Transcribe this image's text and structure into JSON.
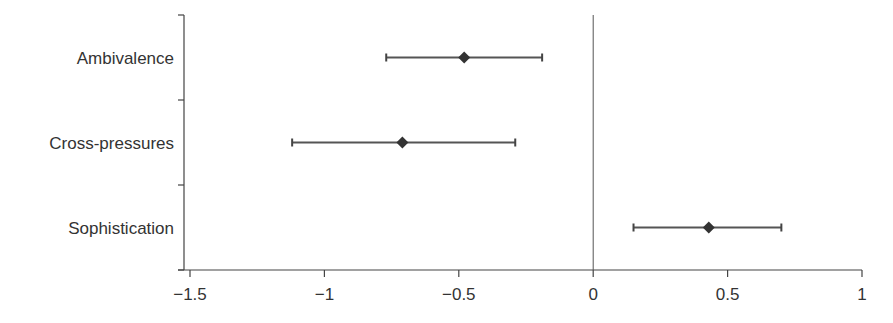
{
  "chart_data": {
    "type": "scatter",
    "subtype": "coefficient-plot-with-confidence-intervals",
    "title": "",
    "xlabel": "",
    "ylabel": "",
    "xlim": [
      -1.5,
      1
    ],
    "xticks": [
      -1.5,
      -1,
      -0.5,
      0,
      0.5,
      1
    ],
    "xtick_labels": [
      "−1.5",
      "−1",
      "−0.5",
      "0",
      "0.5",
      "1"
    ],
    "reference_line_x": 0,
    "grid": false,
    "legend": null,
    "categories": [
      "Ambivalence",
      "Cross-pressures",
      "Sophistication"
    ],
    "series": [
      {
        "name": "Estimate",
        "marker": "diamond",
        "color": "#333333",
        "values": [
          -0.48,
          -0.71,
          0.43
        ],
        "ci_lower": [
          -0.77,
          -1.12,
          0.15
        ],
        "ci_upper": [
          -0.19,
          -0.29,
          0.7
        ]
      }
    ]
  }
}
